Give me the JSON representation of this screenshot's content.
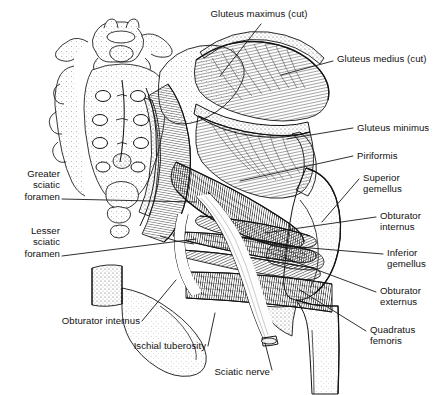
{
  "figure": {
    "style": "grayscale pen-and-ink anatomical line drawing",
    "background_color": "#ffffff",
    "ink_color": "#101010",
    "leader_line_color": "#181818"
  },
  "labels": [
    {
      "id": "gluteus-maximus-cut",
      "text": "Gluteus maximus (cut)",
      "align": "center",
      "x": 183,
      "y": 8,
      "w": 152,
      "leader": [
        [
          261,
          24
        ],
        [
          220,
          76
        ]
      ]
    },
    {
      "id": "gluteus-medius-cut",
      "text": "Gluteus medius (cut)",
      "align": "left",
      "x": 337,
      "y": 53,
      "w": 105,
      "leader": [
        [
          333,
          61
        ],
        [
          281,
          75
        ]
      ]
    },
    {
      "id": "gluteus-minimus",
      "text": "Gluteus minimus",
      "align": "left",
      "x": 357,
      "y": 122,
      "w": 85,
      "leader": [
        [
          353,
          128
        ],
        [
          287,
          139
        ]
      ]
    },
    {
      "id": "piriformis",
      "text": "Piriformis",
      "align": "left",
      "x": 357,
      "y": 150,
      "w": 60,
      "leader": [
        [
          353,
          156
        ],
        [
          240,
          181
        ]
      ]
    },
    {
      "id": "superior-gemellus",
      "text": "Superior\ngemellus",
      "align": "left",
      "x": 363,
      "y": 172,
      "w": 79,
      "leader": [
        [
          359,
          179
        ],
        [
          322,
          222
        ]
      ]
    },
    {
      "id": "obturator-internus-right",
      "text": "Obturator\ninternus",
      "align": "left",
      "x": 380,
      "y": 210,
      "w": 62,
      "leader": [
        [
          376,
          217
        ],
        [
          265,
          233
        ]
      ]
    },
    {
      "id": "inferior-gemellus",
      "text": "Inferior\ngemellus",
      "align": "left",
      "x": 387,
      "y": 247,
      "w": 55,
      "leader": [
        [
          383,
          254
        ],
        [
          286,
          246
        ]
      ]
    },
    {
      "id": "obturator-externus",
      "text": "Obturator\nexternus",
      "align": "left",
      "x": 380,
      "y": 285,
      "w": 62,
      "leader": [
        [
          376,
          292
        ],
        [
          280,
          256
        ]
      ]
    },
    {
      "id": "quadratus-femoris",
      "text": "Quadratus\nfemoris",
      "align": "left",
      "x": 370,
      "y": 324,
      "w": 72,
      "leader": [
        [
          366,
          331
        ],
        [
          300,
          290
        ]
      ]
    },
    {
      "id": "greater-sciatic-foramen",
      "text": "Greater\nsciatic\nforamen",
      "align": "right",
      "x": 2,
      "y": 168,
      "w": 58,
      "leader": [
        [
          62,
          199
        ],
        [
          196,
          202
        ]
      ]
    },
    {
      "id": "lesser-sciatic-foramen",
      "text": "Lesser\nsciatic\nforamen",
      "align": "right",
      "x": 2,
      "y": 225,
      "w": 58,
      "leader": [
        [
          62,
          256
        ],
        [
          196,
          239
        ]
      ]
    },
    {
      "id": "obturator-internus-left",
      "text": "Obturator internus",
      "align": "right",
      "x": 48,
      "y": 315,
      "w": 92,
      "leader": [
        [
          142,
          321
        ],
        [
          176,
          280
        ]
      ]
    },
    {
      "id": "ischial-tuberosity",
      "text": "Ischial tuberosity",
      "align": "right",
      "x": 118,
      "y": 340,
      "w": 88,
      "leader": [
        [
          208,
          346
        ],
        [
          215,
          313
        ]
      ]
    },
    {
      "id": "sciatic-nerve",
      "text": "Sciatic nerve",
      "align": "right",
      "x": 198,
      "y": 366,
      "w": 72,
      "leader": [
        [
          272,
          370
        ],
        [
          265,
          343
        ]
      ]
    }
  ]
}
